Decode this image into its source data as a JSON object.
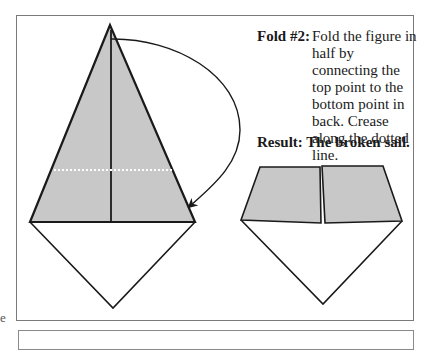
{
  "instruction": {
    "label": "Fold #2:",
    "text": "Fold the figure in half by connecting the top point to the bottom point in back. Crease along the dotted line."
  },
  "result": {
    "text": "Result: The broken sail."
  },
  "margin_fragment": "e",
  "colors": {
    "paper_shade": "#c8c8c8",
    "line": "#1a1a1a",
    "frame": "#7a7a7a"
  },
  "figures": [
    {
      "name": "before-fold",
      "description": "Kite shape with shaded upper triangle, center crease and dotted fold line, curved arrow from top point to bottom"
    },
    {
      "name": "after-fold",
      "description": "Broken sail: shaded split trapezoid above white triangle"
    }
  ]
}
